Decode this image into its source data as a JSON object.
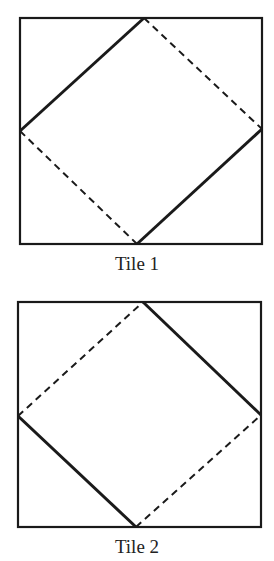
{
  "tiles": [
    {
      "label": "Tile 1",
      "box": [
        20,
        18,
        262,
        244
      ],
      "vertices": {
        "top": [
          144,
          18
        ],
        "right": [
          262,
          129
        ],
        "bottom": [
          137,
          244
        ],
        "left": [
          20,
          131
        ]
      },
      "solid_edges": [
        "top-left",
        "bottom-right"
      ],
      "dashed_edges": [
        "top-right",
        "bottom-left"
      ]
    },
    {
      "label": "Tile 2",
      "box": [
        18,
        302,
        261,
        527
      ],
      "vertices": {
        "top": [
          143,
          302
        ],
        "right": [
          261,
          415
        ],
        "bottom": [
          136,
          527
        ],
        "left": [
          18,
          416
        ]
      },
      "solid_edges": [
        "top-right",
        "bottom-left"
      ],
      "dashed_edges": [
        "top-left",
        "bottom-right"
      ]
    }
  ],
  "colors": {
    "stroke": "#1a1a1a",
    "background": "#ffffff"
  }
}
